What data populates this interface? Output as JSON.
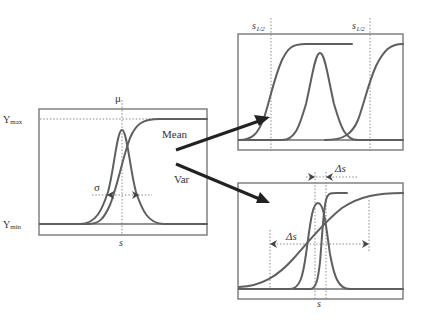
{
  "figure": {
    "left_panel": {
      "mu_label": "μ",
      "ymax_label": "Υmax",
      "ymax_base": "Υ",
      "ymax_sub": "max",
      "ymin_base": "Υ",
      "ymin_sub": "min",
      "sigma_label": "σ",
      "x_label": "s"
    },
    "arrows": {
      "mean_label": "Mean",
      "var_label": "Var"
    },
    "top_right_panel": {
      "threshold_label_left_base": "s",
      "threshold_label_left_sub": "1/2",
      "threshold_label_right_base": "s",
      "threshold_label_right_sub": "1/2"
    },
    "bottom_right_panel": {
      "delta_top_label": "Δs",
      "delta_wide_label": "Δs",
      "x_label": "s"
    },
    "colors": {
      "curve": "#5f5f5f",
      "frame": "#6e6e6e",
      "arrow": "#222222"
    }
  }
}
